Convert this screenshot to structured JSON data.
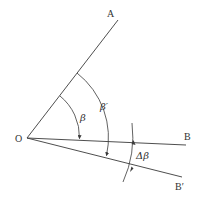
{
  "diagram": {
    "title": "",
    "points": {
      "origin": {
        "label": "O"
      },
      "a": {
        "label": "A"
      },
      "b": {
        "label": "B"
      },
      "b_prime": {
        "label": "B′"
      }
    },
    "angles": {
      "beta": {
        "label": "β",
        "from": "OA",
        "to": "OB"
      },
      "beta_prime": {
        "label": "β′",
        "from": "OA",
        "to": "OB′"
      },
      "delta_beta": {
        "label": "Δβ",
        "from": "OB",
        "to": "OB′"
      }
    },
    "colors": {
      "stroke": "#3a3a3a",
      "text": "#333333",
      "background": "#ffffff"
    }
  }
}
